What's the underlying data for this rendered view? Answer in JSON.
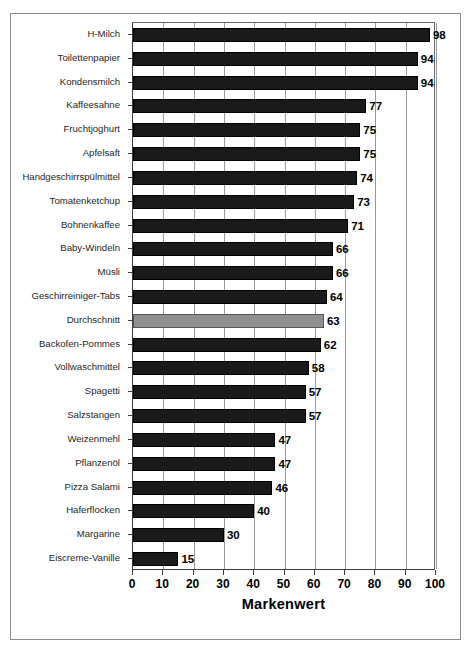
{
  "chart_data": {
    "type": "bar",
    "orientation": "horizontal",
    "title": "",
    "xlabel": "Markenwert",
    "ylabel": "",
    "xlim": [
      0,
      100
    ],
    "xticks": [
      0,
      10,
      20,
      30,
      40,
      50,
      60,
      70,
      80,
      90,
      100
    ],
    "grid": true,
    "grid_axis": "x",
    "legend": null,
    "categories": [
      "H-Milch",
      "Toilettenpapier",
      "Kondensmilch",
      "Kaffeesahne",
      "Fruchtjoghurt",
      "Apfelsaft",
      "Handgeschirrspülmittel",
      "Tomatenketchup",
      "Bohnenkaffee",
      "Baby-Windeln",
      "Müsli",
      "Geschirreiniger-Tabs",
      "Durchschnitt",
      "Backofen-Pommes",
      "Vollwaschmittel",
      "Spagetti",
      "Salzstangen",
      "Weizenmehl",
      "Pflanzenöl",
      "Pizza Salami",
      "Haferflocken",
      "Margarine",
      "Eiscreme-Vanille"
    ],
    "values": [
      98,
      94,
      94,
      77,
      75,
      75,
      74,
      73,
      71,
      66,
      66,
      64,
      63,
      62,
      58,
      57,
      57,
      47,
      47,
      46,
      40,
      30,
      15
    ],
    "highlight_index": 12,
    "colors": {
      "bar": "#1a1a1a",
      "highlight_bar": "#8f8f8f",
      "grid": "#9a9a9a",
      "axis": "#3b3b3b",
      "background": "#ffffff"
    }
  },
  "caption": {
    "text": ""
  }
}
